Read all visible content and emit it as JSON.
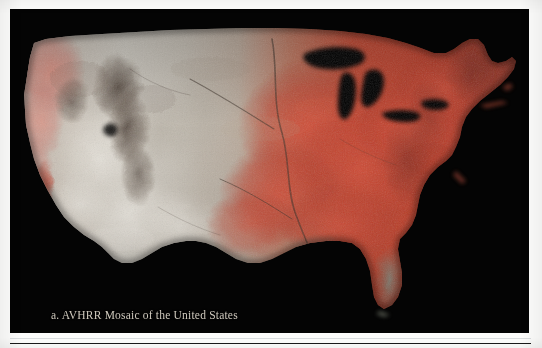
{
  "figure": {
    "caption": "a. AVHRR Mosaic of the United States",
    "plate_background": "#040404",
    "caption_color": "#cfc9bd"
  },
  "map_data": {
    "type": "satellite-mosaic",
    "sensor": "AVHRR",
    "region": "United States",
    "rendering": "false-colour composite",
    "palette": {
      "dense_vegetation": "#c0392b",
      "vegetation_bright": "#e0563c",
      "mixed_vegetation": "#d98a78",
      "grassland": "#b49c90",
      "arid_basin": "#cdc9c0",
      "desert_bright": "#e6e3dc",
      "mountain_shadow": "#5d5349",
      "forest_dark": "#7a3b2e",
      "water_mask": "#000000"
    },
    "regions": [
      {
        "name": "Pacific Northwest",
        "tone": "salmon-pink",
        "color": "#d9897c"
      },
      {
        "name": "California Coast Ranges",
        "tone": "pale grey-green",
        "color": "#c3bdb2"
      },
      {
        "name": "Central Valley",
        "tone": "light red",
        "color": "#cf7b68"
      },
      {
        "name": "Great Basin",
        "tone": "pale grey",
        "color": "#cfcac1"
      },
      {
        "name": "Desert Southwest",
        "tone": "bright white-grey",
        "color": "#e6e2db"
      },
      {
        "name": "Rocky Mountains",
        "tone": "dark mottled",
        "color": "#6a5c50"
      },
      {
        "name": "Great Plains (west)",
        "tone": "grey-tan",
        "color": "#b5ab9d"
      },
      {
        "name": "Great Plains (east)",
        "tone": "strong red",
        "color": "#c4412f"
      },
      {
        "name": "Midwest / Corn Belt",
        "tone": "vivid red",
        "color": "#cd4431"
      },
      {
        "name": "Appalachians",
        "tone": "deep red-brown",
        "color": "#93382c"
      },
      {
        "name": "Southeast",
        "tone": "red",
        "color": "#c14a35"
      },
      {
        "name": "Florida Peninsula",
        "tone": "grey-green",
        "color": "#8e9285"
      },
      {
        "name": "Northeast / Maine",
        "tone": "dark red",
        "color": "#7e3528"
      },
      {
        "name": "Great Lakes",
        "tone": "black water mask",
        "color": "#000000"
      }
    ]
  }
}
